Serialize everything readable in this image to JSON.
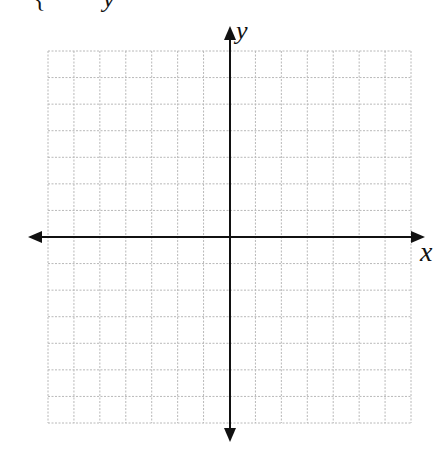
{
  "diagram": {
    "type": "coordinate-grid",
    "x_axis_label": "x",
    "y_axis_label": "y",
    "top_cut_text": {
      "left": "{",
      "right": "y"
    },
    "grid": {
      "columns": 14,
      "rows": 14,
      "left": 48,
      "top": 51,
      "right": 411,
      "bottom": 423,
      "origin": {
        "x": 230,
        "y": 237
      },
      "line_style": "dotted",
      "line_color": "#b8b8b8"
    },
    "axes": {
      "color": "#111111",
      "x_arrow_left": 28,
      "x_arrow_right": 425,
      "y_arrow_top": 26,
      "y_arrow_bottom": 442
    }
  }
}
